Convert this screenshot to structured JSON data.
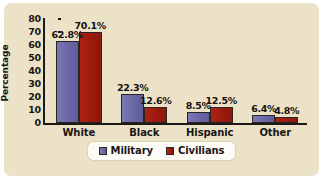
{
  "chart_data": {
    "type": "bar",
    "title": "",
    "xlabel": "",
    "ylabel": "Percentage",
    "categories": [
      "White",
      "Black",
      "Hispanic",
      "Other"
    ],
    "series": [
      {
        "name": "Military",
        "color": "#6d6aa8",
        "values": [
          62.8,
          22.3,
          8.5,
          6.4
        ],
        "labels": [
          "62.8%",
          "22.3%",
          "8.5%",
          "6.4%"
        ]
      },
      {
        "name": "Civilians",
        "color": "#9c1b0e",
        "values": [
          70.1,
          12.6,
          12.5,
          4.8
        ],
        "labels": [
          "70.1%",
          "12.6%",
          "12.5%",
          "4.8%"
        ]
      }
    ],
    "ylim": [
      0,
      80
    ],
    "yticks": [
      0,
      10,
      20,
      30,
      40,
      50,
      60,
      70,
      80
    ],
    "ytick_labels": [
      "0",
      "10",
      "20",
      "30",
      "40",
      "50",
      "60",
      "70",
      "80"
    ],
    "grid": false,
    "legend_position": "bottom"
  },
  "legend": {
    "items": [
      {
        "label": "Military"
      },
      {
        "label": "Civilians"
      }
    ]
  },
  "colors": {
    "panel_background": "#ece2c8",
    "page_background": "#ffffff",
    "axis": "#1c1a16",
    "text": "#1a1713",
    "legend_background": "#fdfbf6"
  }
}
